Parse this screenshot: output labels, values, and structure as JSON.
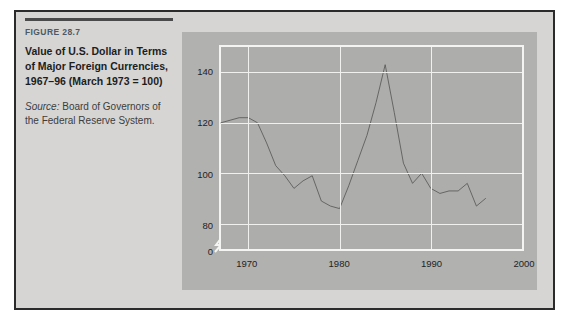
{
  "figure": {
    "label": "FIGURE 28.7",
    "title": "Value of U.S. Dollar in Terms of Major Foreign Currencies, 1967–96 (March 1973 = 100)",
    "source_word": "Source:",
    "source_text": " Board of Governors of the Federal Reserve System.",
    "accent_color": "#4a5a68",
    "panel_color": "#d6d5d3",
    "chart_bg_color": "#b1b1af",
    "plot_bg_color": "#adadab",
    "gridline_color": "#f0f0ee",
    "line_color": "#595959"
  },
  "chart_data": {
    "type": "line",
    "title": "Value of U.S. Dollar in Terms of Major Foreign Currencies, 1967–96 (March 1973 = 100)",
    "xlabel": "",
    "ylabel": "",
    "xlim": [
      1967,
      2000
    ],
    "ylim": [
      70,
      150
    ],
    "ytick_labels": [
      "140",
      "120",
      "100",
      "80",
      "0"
    ],
    "yticks": [
      140,
      120,
      100,
      80,
      0
    ],
    "xtick_labels": [
      "1970",
      "1980",
      "1990",
      "2000"
    ],
    "xticks": [
      1970,
      1980,
      1990,
      2000
    ],
    "grid": true,
    "legend": null,
    "axis_break": true,
    "axis_break_note": "y-axis broken between 80 and 0",
    "series": [
      {
        "name": "Trade-weighted value of U.S. dollar",
        "x": [
          1967,
          1968,
          1969,
          1970,
          1971,
          1972,
          1973,
          1974,
          1975,
          1976,
          1977,
          1978,
          1979,
          1980,
          1981,
          1982,
          1983,
          1984,
          1985,
          1986,
          1987,
          1988,
          1989,
          1990,
          1991,
          1992,
          1993,
          1994,
          1995,
          1996
        ],
        "values": [
          120,
          121,
          122,
          122,
          120,
          112,
          103,
          99,
          94,
          97,
          99,
          89,
          87,
          86,
          95,
          105,
          115,
          128,
          143,
          124,
          104,
          96,
          100,
          94,
          92,
          93,
          93,
          96,
          87,
          90
        ]
      }
    ]
  }
}
